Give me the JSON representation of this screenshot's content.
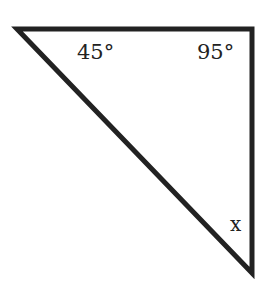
{
  "diagram": {
    "type": "triangle",
    "vertices": {
      "top_left": [
        15,
        28
      ],
      "top_right": [
        253,
        28
      ],
      "bottom": [
        253,
        275
      ]
    },
    "stroke_color": "#222222",
    "labels": {
      "angle_top_left": "45°",
      "angle_top_right": "95°",
      "angle_bottom": "x"
    }
  }
}
